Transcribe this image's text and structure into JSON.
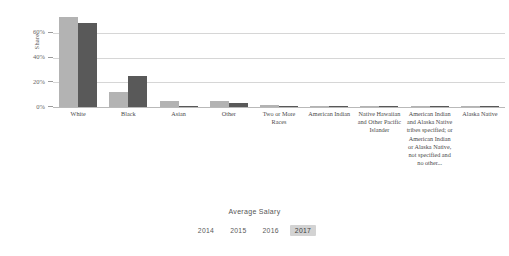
{
  "chart_data": {
    "type": "bar",
    "title": "",
    "xlabel": "",
    "ylabel": "Share",
    "ylim": [
      0,
      80
    ],
    "grid": true,
    "ytick_labels": [
      "0%",
      "20%",
      "40%",
      "60%"
    ],
    "ytick_values": [
      0,
      20,
      40,
      60
    ],
    "legend_position": "bottom",
    "categories": [
      "White",
      "Black",
      "Asian",
      "Other",
      "Two or More Races",
      "American Indian",
      "Native Hawaiian and Other Pacific Islander",
      "American Indian and Alaska Native tribes specified; or American Indian or Alaska Native, not specified and no other...",
      "Alaska Native"
    ],
    "series": [
      {
        "name": "Series 1",
        "color": "#b3b3b3",
        "values": [
          73,
          12,
          5,
          5,
          2,
          0.6,
          0.4,
          0.3,
          0.2
        ]
      },
      {
        "name": "Series 2",
        "color": "#595959",
        "values": [
          68,
          25,
          1.2,
          3,
          1.2,
          0.5,
          0.3,
          0.2,
          0.2
        ]
      }
    ]
  },
  "legend": {
    "title": "Average Salary",
    "items": [
      {
        "label": "2014",
        "selected": false
      },
      {
        "label": "2015",
        "selected": false
      },
      {
        "label": "2016",
        "selected": false
      },
      {
        "label": "2017",
        "selected": true
      }
    ]
  },
  "colors": {
    "bar_light": "#b3b3b3",
    "bar_dark": "#595959",
    "gridline": "#d6d6d6",
    "axis": "#b9b9b9",
    "legend_selected_bg": "#d3d3d3",
    "text": "#4a4a4a"
  }
}
